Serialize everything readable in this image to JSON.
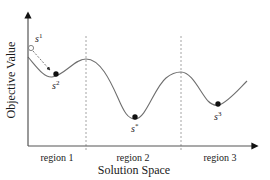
{
  "diagram": {
    "y_axis_label": "Objective Value",
    "x_axis_label": "Solution Space",
    "regions": [
      {
        "label": "region 1"
      },
      {
        "label": "region 2"
      },
      {
        "label": "region 3"
      }
    ],
    "points": [
      {
        "id": "s1",
        "base": "s",
        "sup": "1",
        "marker": "open-circle"
      },
      {
        "id": "s2",
        "base": "s",
        "sup": "2",
        "marker": "filled-circle"
      },
      {
        "id": "s_star",
        "base": "s",
        "sup": "*",
        "marker": "filled-circle"
      },
      {
        "id": "s3",
        "base": "s",
        "sup": "3",
        "marker": "filled-circle"
      }
    ],
    "colors": {
      "axis": "#333333",
      "curve": "#6e6e6e",
      "divider": "#9a9a9a",
      "marker": "#111111"
    }
  }
}
